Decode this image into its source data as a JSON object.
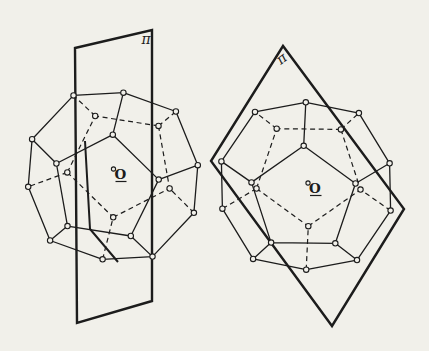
{
  "page": {
    "background": "#f1f0ea",
    "ink": "#1c1c1c",
    "width": 429,
    "height": 351
  },
  "style": {
    "edge_width": 1.3,
    "hidden_edge_width": 1.2,
    "hidden_dash": "5 3.6",
    "plane_outline_width": 2.4,
    "trace_width": 2.0,
    "vertex_radius": 2.7,
    "vertex_stroke_width": 1.1,
    "vertex_fill": "#f1f0ea",
    "plane_label_font_size": 14,
    "point_label_font_size": 13.5
  },
  "solid": {
    "type": "regular-dodecahedron",
    "vertex_marker": "open-circle",
    "visible_edges": "solid",
    "hidden_edges": "dashed"
  },
  "figures": [
    {
      "name": "dodecahedron-with-vertical-symmetry-plane",
      "center": [
        113,
        176
      ],
      "scale": 52,
      "rotation_deg": [
        64,
        -10,
        27
      ],
      "plane": {
        "label": "π",
        "label_pos": [
          146,
          40
        ],
        "label_rotation": 0,
        "points": [
          [
            75,
            48
          ],
          [
            152,
            30
          ],
          [
            152,
            301
          ],
          [
            77,
            323
          ]
        ],
        "trace": [
          [
            85,
            141
          ],
          [
            90,
            229
          ],
          [
            118,
            262
          ]
        ]
      },
      "center_point": {
        "label": "O",
        "marker_pos": [
          113.5,
          169
        ],
        "marker_radius": 2.1,
        "label_pos": [
          120.5,
          175.5
        ],
        "underline": [
          [
            115.5,
            181.5
          ],
          [
            126.5,
            181.5
          ]
        ]
      }
    },
    {
      "name": "dodecahedron-with-oblique-symmetry-plane",
      "center": [
        306,
        186
      ],
      "scale": 52,
      "rotation_deg": [
        66,
        -8,
        35
      ],
      "plane": {
        "label": "π",
        "label_pos": [
          282,
          59
        ],
        "label_rotation": -38,
        "points": [
          [
            283,
            46
          ],
          [
            211,
            161
          ],
          [
            332,
            326
          ],
          [
            404,
            209
          ]
        ],
        "trace": null
      },
      "center_point": {
        "label": "O",
        "marker_pos": [
          308,
          183
        ],
        "marker_radius": 2.1,
        "label_pos": [
          315,
          189.5
        ],
        "underline": [
          [
            310,
            195.5
          ],
          [
            321.5,
            195.5
          ]
        ]
      }
    }
  ]
}
